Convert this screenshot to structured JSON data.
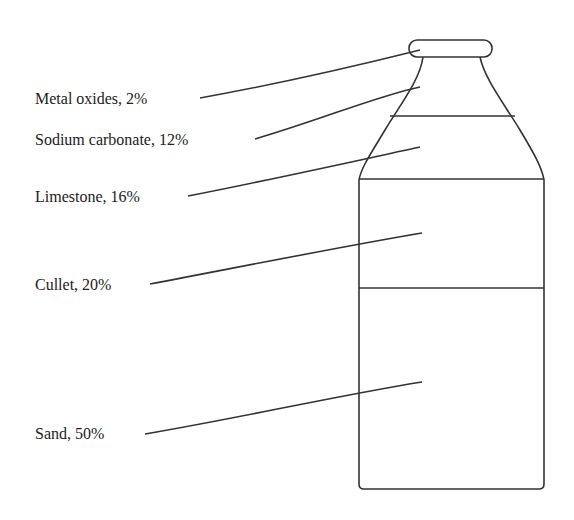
{
  "diagram": {
    "type": "labeled-bottle",
    "components": [
      {
        "label": "Metal oxides, 2%",
        "name": "Metal oxides",
        "percent": 2
      },
      {
        "label": "Sodium carbonate, 12%",
        "name": "Sodium carbonate",
        "percent": 12
      },
      {
        "label": "Limestone, 16%",
        "name": "Limestone",
        "percent": 16
      },
      {
        "label": "Cullet, 20%",
        "name": "Cullet",
        "percent": 20
      },
      {
        "label": "Sand, 50%",
        "name": "Sand",
        "percent": 50
      }
    ],
    "colors": {
      "stroke": "#333333",
      "text": "#222222",
      "background": "#ffffff"
    }
  }
}
